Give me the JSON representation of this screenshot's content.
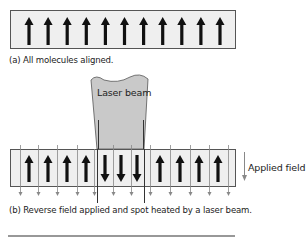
{
  "panel_a": {
    "caption": "(a) All molecules aligned.",
    "arrow_count": 11,
    "arrow_direction": "up"
  },
  "panel_b": {
    "caption": "(b) Reverse field applied and spot heated by a laser beam.",
    "laser_label": "Laser beam",
    "field_label": "Applied field",
    "arrows": [
      "up",
      "up",
      "up",
      "up",
      "down",
      "down",
      "down",
      "up",
      "up",
      "up",
      "up"
    ]
  },
  "colors": {
    "box_fill": "#efefef",
    "box_stroke": "#555555",
    "arrow": "#111111",
    "field_line": "#888888",
    "laser_fill": "#c9c9c9"
  }
}
